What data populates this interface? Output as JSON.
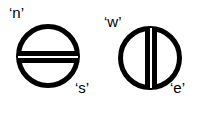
{
  "figure": {
    "background_color": "#ffffff",
    "stroke_color": "#000000",
    "width": 204,
    "height": 115,
    "glyphs": [
      {
        "id": "ns-glyph",
        "name": "north-south-glyph",
        "description": "circle bisected by a horizontal double bar",
        "center_x": 48,
        "center_y": 56,
        "radius": 30,
        "ring_thickness": 5,
        "bar_orientation": "horizontal",
        "bar_thickness": 5,
        "gap_thickness": 2,
        "labels": [
          {
            "key": "n",
            "text": "‘n’",
            "position": "top-left"
          },
          {
            "key": "s",
            "text": "‘s’",
            "position": "bottom-right"
          }
        ]
      },
      {
        "id": "we-glyph",
        "name": "west-east-glyph",
        "description": "circle bisected by a vertical double bar",
        "center_x": 150,
        "center_y": 58,
        "radius": 30,
        "ring_thickness": 5,
        "bar_orientation": "vertical",
        "bar_thickness": 5,
        "gap_thickness": 2,
        "labels": [
          {
            "key": "w",
            "text": "‘w’",
            "position": "top-left"
          },
          {
            "key": "e",
            "text": "‘e’",
            "position": "bottom-right"
          }
        ]
      }
    ]
  },
  "labels": {
    "n": "‘n’",
    "s": "‘s’",
    "w": "‘w’",
    "e": "‘e’"
  }
}
